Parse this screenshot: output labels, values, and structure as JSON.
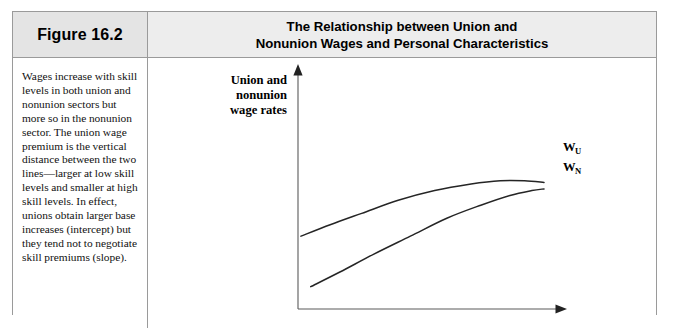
{
  "figure": {
    "number_label": "Figure 16.2",
    "title_lines": [
      "The Relationship between Union and",
      "Nonunion Wages and Personal Characteristics"
    ],
    "caption": "Wages increase with skill levels in both union and nonunion sectors but more so in the nonunion sector. The union wage premium is the vertical distance between the two lines—larger at low skill levels and smaller at high skill levels. In effect, unions obtain larger base increases (intercept) but they tend not to negotiate skill premiums (slope)."
  },
  "colors": {
    "panel_border": "#9a9a9a",
    "header_band": "#ededed",
    "figure_number_box": "#e4e4e4",
    "axis": "#5a5a5a",
    "curve": "#252525",
    "text": "#000000"
  },
  "chart_data": {
    "type": "line",
    "title": "The Relationship between Union and Nonunion Wages and Personal Characteristics",
    "xlabel": "Skill level",
    "ylabel": "Union and nonunion wage rates",
    "ylabel_lines": [
      "Union and",
      "nonunion",
      "wage rates"
    ],
    "grid": false,
    "axis_ticks": false,
    "legend": "inline-end-labels",
    "xlim": [
      0,
      100
    ],
    "ylim": [
      0,
      100
    ],
    "series": [
      {
        "name": "W_U",
        "label_main": "W",
        "label_sub": "U",
        "description": "Union wage rate — higher intercept, flatter slope, concave peaking then slightly declining",
        "x": [
          0,
          12,
          25,
          40,
          55,
          70,
          82,
          92,
          100
        ],
        "y": [
          41,
          48,
          55,
          63,
          69,
          73,
          75,
          75,
          74
        ]
      },
      {
        "name": "W_N",
        "label_main": "W",
        "label_sub": "N",
        "description": "Nonunion wage rate — lower intercept, steeper slope, converging toward union line at high skill",
        "x": [
          4,
          16,
          30,
          45,
          60,
          74,
          86,
          95,
          100
        ],
        "y": [
          10,
          19,
          30,
          41,
          52,
          60,
          66,
          69,
          70
        ]
      }
    ],
    "annotations": [
      "Union wage premium is the vertical gap between W_U and W_N",
      "Gap is larger at low skill levels and smaller at high skill levels"
    ]
  }
}
